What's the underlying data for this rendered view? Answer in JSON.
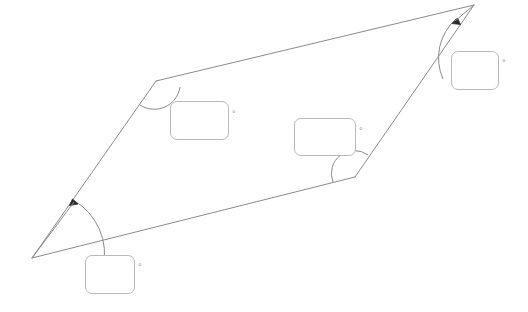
{
  "canvas": {
    "width": 528,
    "height": 312,
    "background_color": "#ffffff"
  },
  "figure": {
    "name": "parallelogram-angle-diagram",
    "stroke_color": "#8a8a8a",
    "arc_color": "#8a8a8a",
    "marker_color": "#2b2b2b",
    "stroke_width": 1,
    "vertices": [
      {
        "id": "bottom-left",
        "label": "A",
        "x": 32,
        "y": 258
      },
      {
        "id": "top-left",
        "label": "B",
        "x": 156,
        "y": 81
      },
      {
        "id": "top-right",
        "label": "C",
        "x": 474,
        "y": 5
      },
      {
        "id": "bottom-right",
        "label": "D",
        "x": 355,
        "y": 177
      }
    ],
    "edges": [
      {
        "from": "bottom-left",
        "to": "top-left"
      },
      {
        "from": "top-left",
        "to": "top-right"
      },
      {
        "from": "top-right",
        "to": "bottom-right"
      },
      {
        "from": "bottom-right",
        "to": "bottom-left"
      }
    ],
    "angle_arcs": [
      {
        "vertex": "bottom-left",
        "radius": 62,
        "has_arrow_marker": true,
        "style": "swept-arrow"
      },
      {
        "vertex": "top-left",
        "radius": 24,
        "has_arrow_marker": false,
        "style": "plain-arc"
      },
      {
        "vertex": "top-right",
        "radius": 52,
        "has_arrow_marker": true,
        "style": "swept-arrow"
      },
      {
        "vertex": "bottom-right",
        "radius": 22,
        "has_arrow_marker": false,
        "style": "plain-arc"
      }
    ]
  },
  "inputs": [
    {
      "id": "field-topleft",
      "name": "angle-input-top-left",
      "value": "",
      "placeholder": "",
      "unit_symbol": "°",
      "associated_vertex": "top-left"
    },
    {
      "id": "field-middle",
      "name": "angle-input-bottom-right",
      "value": "",
      "placeholder": "",
      "unit_symbol": "°",
      "associated_vertex": "bottom-right"
    },
    {
      "id": "field-right",
      "name": "angle-input-top-right",
      "value": "",
      "placeholder": "",
      "unit_symbol": "°",
      "associated_vertex": "top-right"
    },
    {
      "id": "field-bottom",
      "name": "angle-input-bottom-left",
      "value": "",
      "placeholder": "",
      "unit_symbol": "°",
      "associated_vertex": "bottom-left"
    }
  ]
}
